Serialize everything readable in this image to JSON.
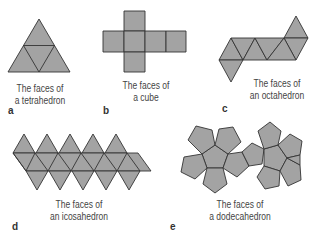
{
  "colors": {
    "face_fill": "#a3a3a3",
    "edge": "#333333",
    "text": "#444444"
  },
  "panels": [
    {
      "label": "a",
      "caption_line1": "The faces of",
      "caption_line2": "a tetrahedron",
      "solid": "tetrahedron",
      "faces": 4
    },
    {
      "label": "b",
      "caption_line1": "The faces of",
      "caption_line2": "a cube",
      "solid": "cube",
      "faces": 6
    },
    {
      "label": "c",
      "caption_line1": "The faces of",
      "caption_line2": "an octahedron",
      "solid": "octahedron",
      "faces": 8
    },
    {
      "label": "d",
      "caption_line1": "The faces of",
      "caption_line2": "an icosahedron",
      "solid": "icosahedron",
      "faces": 20
    },
    {
      "label": "e",
      "caption_line1": "The faces of",
      "caption_line2": "a dodecahedron",
      "solid": "dodecahedron",
      "faces": 12
    }
  ]
}
